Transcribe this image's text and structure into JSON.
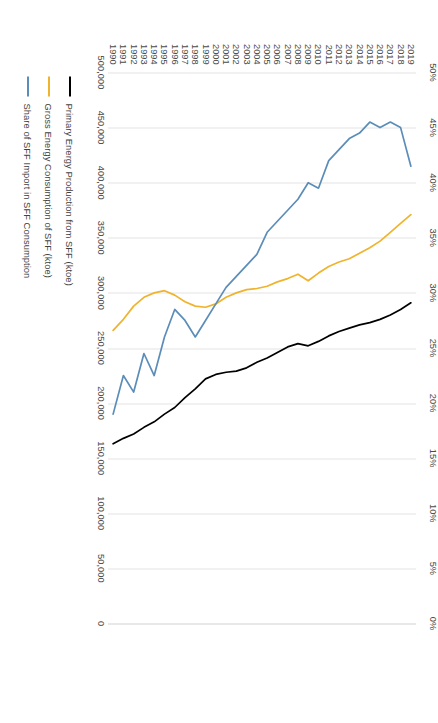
{
  "chart_data": {
    "type": "line",
    "title": "",
    "subtitle": "",
    "orientation": "rotated-90-clockwise",
    "xlabel": "",
    "ylabel": "",
    "grid": true,
    "legend_position": "bottom",
    "categories": [
      "1990",
      "1991",
      "1992",
      "1993",
      "1994",
      "1995",
      "1996",
      "1997",
      "1998",
      "1999",
      "2000",
      "2001",
      "2002",
      "2003",
      "2004",
      "2005",
      "2006",
      "2007",
      "2008",
      "2009",
      "2010",
      "2011",
      "2012",
      "2013",
      "2014",
      "2015",
      "2016",
      "2017",
      "2018",
      "2019"
    ],
    "primary_axis": {
      "label": "ktoe",
      "ticks": [
        "0",
        "50,000",
        "100,000",
        "150,000",
        "200,000",
        "250,000",
        "300,000",
        "350,000",
        "400,000",
        "450,000",
        "500,000"
      ],
      "tick_values": [
        0,
        50000,
        100000,
        150000,
        200000,
        250000,
        300000,
        350000,
        400000,
        450000,
        500000
      ],
      "min": 0,
      "max": 500000
    },
    "secondary_axis": {
      "label": "%",
      "ticks": [
        "0%",
        "5%",
        "10%",
        "15%",
        "20%",
        "25%",
        "30%",
        "35%",
        "40%",
        "45%",
        "50%"
      ],
      "tick_values": [
        0,
        5,
        10,
        15,
        20,
        25,
        30,
        35,
        40,
        45,
        50
      ],
      "min": 0,
      "max": 50
    },
    "series": [
      {
        "name": "Primary Energy Production from SFF (ktoe)",
        "color": "#000000",
        "axis": "primary",
        "values": [
          163000,
          168000,
          172000,
          178000,
          183000,
          190000,
          196000,
          205000,
          213000,
          222000,
          226000,
          228000,
          229000,
          232000,
          237000,
          241000,
          246000,
          251000,
          254000,
          252000,
          256000,
          261000,
          265000,
          268000,
          271000,
          273000,
          276000,
          280000,
          285000,
          291000
        ]
      },
      {
        "name": "Gross Energy Consumption of SFF (ktoe)",
        "color": "#F0B32D",
        "axis": "primary",
        "values": [
          266000,
          276000,
          288000,
          296000,
          300000,
          302000,
          298000,
          292000,
          288000,
          287000,
          290000,
          296000,
          300000,
          303000,
          304000,
          306000,
          310000,
          313000,
          317000,
          311000,
          318000,
          324000,
          328000,
          331000,
          336000,
          341000,
          347000,
          355000,
          363000,
          371000
        ]
      },
      {
        "name": "Share of SFF Import in SFF Consumption",
        "color": "#5B8DB8",
        "axis": "secondary",
        "values": [
          19.0,
          22.5,
          21.0,
          24.5,
          22.5,
          26.0,
          28.5,
          27.5,
          26.0,
          27.5,
          29.0,
          30.5,
          31.5,
          32.5,
          33.5,
          35.5,
          36.5,
          37.5,
          38.5,
          40.0,
          39.5,
          42.0,
          43.0,
          44.0,
          44.5,
          45.5,
          45.0,
          45.5,
          45.0,
          41.5
        ]
      }
    ],
    "legend": [
      {
        "label": "Primary Energy Production from SFF (ktoe)",
        "color": "#000000"
      },
      {
        "label": "Gross Energy Consumption of SFF (ktoe)",
        "color": "#F0B32D"
      },
      {
        "label": "Share of SFF Import in SFF Consumption",
        "color": "#5B8DB8"
      }
    ]
  },
  "colors": {
    "gridline": "#E3E3E3",
    "axis_text": "#4A4A4A",
    "background": "#FFFFFF"
  }
}
